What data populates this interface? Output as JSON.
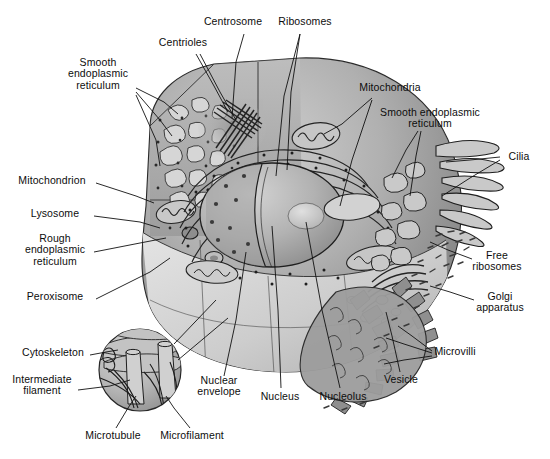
{
  "figure": {
    "kind": "labeled-biology-diagram",
    "palette": {
      "background": "#ffffff",
      "ink": "#0d0d0d",
      "leader_line": "#111111",
      "cytoplasm_mid": "#a9a9a9",
      "cytoplasm_light": "#d2d2d2",
      "cytoplasm_dark": "#6e6e6e",
      "organelle_fill": "#c2c2c2",
      "nucleus_fill": "#b4b4b4",
      "nucleolus_fill": "#c9c9c9",
      "outline": "#2a2a2a"
    },
    "style": "grayscale pen-and-ink airbrush textbook illustration"
  },
  "labels": [
    {
      "id": "centrosome",
      "text": "Centrosome",
      "x": 233,
      "y": 22,
      "align": "c"
    },
    {
      "id": "ribosomes",
      "text": "Ribosomes",
      "x": 305,
      "y": 22,
      "align": "c"
    },
    {
      "id": "centrioles",
      "text": "Centrioles",
      "x": 183,
      "y": 43,
      "align": "c"
    },
    {
      "id": "smooth-er-left",
      "text": "Smooth\nendoplasmic\nreticulum",
      "x": 98,
      "y": 74,
      "align": "c"
    },
    {
      "id": "mitochondria",
      "text": "Mitochondria",
      "x": 390,
      "y": 88,
      "align": "c"
    },
    {
      "id": "smooth-er-right",
      "text": "Smooth endoplasmic\nreticulum",
      "x": 430,
      "y": 118,
      "align": "c"
    },
    {
      "id": "cilia",
      "text": "Cilia",
      "x": 519,
      "y": 157,
      "align": "c"
    },
    {
      "id": "mitochondrion",
      "text": "Mitochondrion",
      "x": 52,
      "y": 181,
      "align": "c"
    },
    {
      "id": "lysosome",
      "text": "Lysosome",
      "x": 55,
      "y": 214,
      "align": "c"
    },
    {
      "id": "rough-er",
      "text": "Rough\nendoplasmic\nreticulum",
      "x": 55,
      "y": 250,
      "align": "c"
    },
    {
      "id": "free-ribosomes",
      "text": "Free\nribosomes",
      "x": 497,
      "y": 261,
      "align": "c"
    },
    {
      "id": "peroxisome",
      "text": "Peroxisome",
      "x": 55,
      "y": 297,
      "align": "c"
    },
    {
      "id": "golgi-apparatus",
      "text": "Golgi\napparatus",
      "x": 500,
      "y": 302,
      "align": "c"
    },
    {
      "id": "cytoskeleton",
      "text": "Cytoskeleton",
      "x": 53,
      "y": 353,
      "align": "c"
    },
    {
      "id": "microvilli",
      "text": "Microvilli",
      "x": 455,
      "y": 352,
      "align": "c"
    },
    {
      "id": "nuclear-envelope",
      "text": "Nuclear\nenvelope",
      "x": 219,
      "y": 386,
      "align": "c"
    },
    {
      "id": "vesicle",
      "text": "Vesicle",
      "x": 401,
      "y": 380,
      "align": "c"
    },
    {
      "id": "intermediate-filament",
      "text": "Intermediate\nfilament",
      "x": 42,
      "y": 385,
      "align": "c"
    },
    {
      "id": "nucleus",
      "text": "Nucleus",
      "x": 280,
      "y": 397,
      "align": "c"
    },
    {
      "id": "nucleolus",
      "text": "Nucleolus",
      "x": 343,
      "y": 397,
      "align": "c"
    },
    {
      "id": "microtubule",
      "text": "Microtubule",
      "x": 113,
      "y": 436,
      "align": "c"
    },
    {
      "id": "microfilament",
      "text": "Microfilament",
      "x": 192,
      "y": 436,
      "align": "c"
    }
  ],
  "leaders": [
    {
      "id": "leader-centrosome",
      "points": "244,34 236,62 232,118"
    },
    {
      "id": "leader-ribosomes-a",
      "points": "300,34 291,92 287,170"
    },
    {
      "id": "leader-ribosomes-b",
      "points": "300,34 284,96 276,176"
    },
    {
      "id": "leader-centrioles-a",
      "points": "196,54 214,86 228,112"
    },
    {
      "id": "leader-centrioles-b",
      "points": "200,54 220,92 236,120"
    },
    {
      "id": "leader-smootherL-a",
      "points": "136,88 164,102 178,114"
    },
    {
      "id": "leader-smootherL-b",
      "points": "136,92 160,120 172,136"
    },
    {
      "id": "leader-smootherL-c",
      "points": "136,95 156,140 160,166"
    },
    {
      "id": "leader-mito-a",
      "points": "372,98 342,124 324,134"
    },
    {
      "id": "leader-mito-b",
      "points": "372,100 352,160 340,206"
    },
    {
      "id": "leader-smootherR-a",
      "points": "418,131 406,150 392,178"
    },
    {
      "id": "leader-smootherR-b",
      "points": "421,131 416,156 410,196"
    },
    {
      "id": "leader-cilia-a",
      "points": "500,157 470,160 446,162"
    },
    {
      "id": "leader-cilia-b",
      "points": "500,160 470,178 442,196"
    },
    {
      "id": "leader-mitochondrion",
      "points": "96,183 136,196 154,203"
    },
    {
      "id": "leader-lysosome",
      "points": "94,216 140,222 160,228"
    },
    {
      "id": "leader-rougher",
      "points": "94,252 140,243 166,238"
    },
    {
      "id": "leader-peroxisome",
      "points": "96,299 150,272 170,258"
    },
    {
      "id": "leader-freeribosomes",
      "points": "472,259 448,250 430,242"
    },
    {
      "id": "leader-golgi",
      "points": "474,300 450,292 430,286"
    },
    {
      "id": "leader-microvilli-a",
      "points": "432,351 412,336 398,326"
    },
    {
      "id": "leader-microvilli-b",
      "points": "432,353 404,344 386,338"
    },
    {
      "id": "leader-microvilli-c",
      "points": "432,356 404,360 384,364"
    },
    {
      "id": "leader-vesicle",
      "points": "400,372 392,336 386,312"
    },
    {
      "id": "leader-nuclearenvelope",
      "points": "224,376 236,320 246,252"
    },
    {
      "id": "leader-nucleus",
      "points": "281,388 278,310 272,226"
    },
    {
      "id": "leader-nucleolus",
      "points": "340,388 322,310 306,222"
    },
    {
      "id": "leader-cytoskeleton",
      "points": "90,355 106,352 118,350"
    },
    {
      "id": "leader-intermediate",
      "points": "78,390 110,386 130,380"
    },
    {
      "id": "leader-microtubule",
      "points": "116,428 128,408 136,396"
    },
    {
      "id": "leader-microfilament",
      "points": "190,428 174,408 166,396"
    }
  ],
  "structures": {
    "cell_outline_note": "large rounded cell body, flat cut faces upper-left and lower-left",
    "inset": {
      "id": "cytoskeleton-inset",
      "cx": 140,
      "cy": 370,
      "r": 41
    },
    "nucleus": {
      "cx": 272,
      "cy": 215,
      "rx": 72,
      "ry": 52
    },
    "nucleolus": {
      "cx": 306,
      "cy": 216,
      "rx": 18,
      "ry": 13
    }
  }
}
